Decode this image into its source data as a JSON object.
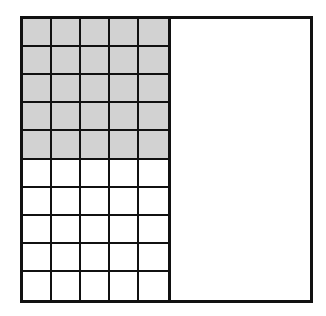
{
  "diagram": {
    "left_half": {
      "columns": 5,
      "rows": 10,
      "shaded_rows": 5,
      "shaded_cells": 25,
      "total_cells": 50
    },
    "right_half": {
      "divided": false
    },
    "colors": {
      "line": "#111111",
      "shaded_fill": "#d2d2d2",
      "unshaded_fill": "#ffffff"
    }
  }
}
